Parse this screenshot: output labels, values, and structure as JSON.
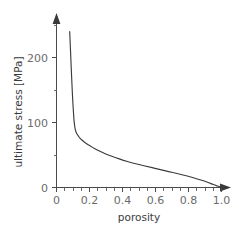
{
  "chart_data": {
    "type": "line",
    "title": "",
    "subtitle": "",
    "xlabel": "porosity",
    "ylabel": "ultimate stress [MPa]",
    "xlim": [
      0,
      1.05
    ],
    "ylim": [
      0,
      265
    ],
    "grid": false,
    "legend": null,
    "background_color": "#ffffff",
    "line_color": "#3c3c3c",
    "axis_color": "#4a4a4a",
    "tick_label_color": "#6b6b6b",
    "axis_style": "arrow-tipped open axes",
    "x_ticks_major": [
      "0",
      "0.2",
      "0.4",
      "0.6",
      "0.8",
      "1.0"
    ],
    "x_tick_values_major": [
      0,
      0.2,
      0.4,
      0.6,
      0.8,
      1.0
    ],
    "x_tick_minor_step": 0.05,
    "y_ticks_major": [
      "0",
      "100",
      "200"
    ],
    "y_tick_values_major": [
      0,
      100,
      200
    ],
    "y_tick_minor_step": 50,
    "y_tick_minor_values": [
      50,
      150,
      250
    ],
    "series": [
      {
        "name": "ultimate stress vs porosity",
        "x": [
          0.08,
          0.082,
          0.085,
          0.088,
          0.091,
          0.094,
          0.097,
          0.1,
          0.103,
          0.106,
          0.11,
          0.114,
          0.119,
          0.125,
          0.133,
          0.142,
          0.154,
          0.168,
          0.185,
          0.205,
          0.23,
          0.26,
          0.295,
          0.335,
          0.38,
          0.43,
          0.48,
          0.53,
          0.58,
          0.63,
          0.68,
          0.73,
          0.78,
          0.83,
          0.875,
          0.915,
          0.95,
          0.975,
          0.99,
          1.0
        ],
        "y": [
          240,
          228,
          210,
          192,
          174,
          157,
          141,
          127,
          115,
          104,
          95,
          89,
          85,
          82,
          79,
          76,
          73,
          70,
          67,
          64,
          60,
          56,
          52,
          48,
          44,
          40,
          36.5,
          33.5,
          30.5,
          27.5,
          24.5,
          21.5,
          18.5,
          15.0,
          11.5,
          8.0,
          4.5,
          2.2,
          0.9,
          0
        ]
      }
    ],
    "annotations": []
  },
  "figure": {
    "x_axis_title": "porosity",
    "y_axis_title": "ultimate stress [MPa]"
  },
  "ticks": {
    "y": [
      {
        "label": "200",
        "value": 200
      },
      {
        "label": "100",
        "value": 100
      },
      {
        "label": "0",
        "value": 0
      }
    ],
    "x": [
      {
        "label": "0",
        "value": 0
      },
      {
        "label": "0.2",
        "value": 0.2
      },
      {
        "label": "0.4",
        "value": 0.4
      },
      {
        "label": "0.6",
        "value": 0.6
      },
      {
        "label": "0.8",
        "value": 0.8
      },
      {
        "label": "1.0",
        "value": 1.0
      }
    ]
  }
}
